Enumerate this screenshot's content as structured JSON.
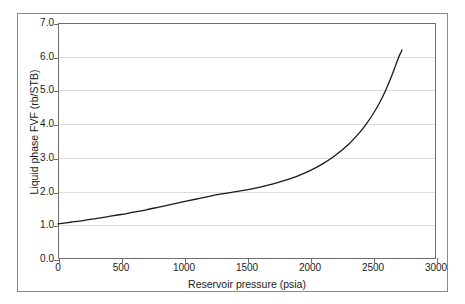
{
  "chart_data": {
    "type": "line",
    "title": "",
    "xlabel": "Reservoir pressure (psia)",
    "ylabel": "Liquid phase FVF (rb/STB)",
    "xlim": [
      0,
      3000
    ],
    "ylim": [
      0,
      7.0
    ],
    "xticks": [
      0,
      500,
      1000,
      1500,
      2000,
      2500,
      3000
    ],
    "xtick_labels": [
      "0",
      "500",
      "1000",
      "1500",
      "2000",
      "2500",
      "3000"
    ],
    "yticks": [
      0.0,
      1.0,
      2.0,
      3.0,
      4.0,
      5.0,
      6.0,
      7.0
    ],
    "ytick_labels": [
      "0.0",
      "1.0",
      "2.0",
      "3.0",
      "4.0",
      "5.0",
      "6.0",
      "7.0"
    ],
    "grid": "horizontal",
    "grid_color": "#dcdcdc",
    "legend": "none",
    "line_color": "#1a1a1a",
    "series": [
      {
        "name": "Liquid phase FVF",
        "x": [
          0,
          100,
          200,
          300,
          400,
          500,
          600,
          700,
          800,
          900,
          1000,
          1100,
          1200,
          1300,
          1400,
          1500,
          1600,
          1700,
          1800,
          1900,
          2000,
          2100,
          2200,
          2300,
          2400,
          2450,
          2500,
          2550,
          2600,
          2650,
          2680,
          2700,
          2720,
          2730
        ],
        "y": [
          1.04,
          1.09,
          1.14,
          1.2,
          1.26,
          1.32,
          1.39,
          1.46,
          1.54,
          1.62,
          1.7,
          1.78,
          1.86,
          1.93,
          1.99,
          2.05,
          2.13,
          2.22,
          2.33,
          2.46,
          2.62,
          2.82,
          3.07,
          3.38,
          3.78,
          4.02,
          4.3,
          4.62,
          5.0,
          5.45,
          5.75,
          5.95,
          6.12,
          6.2
        ]
      }
    ]
  },
  "figure": {
    "border_color": "#8a8a8a",
    "background": "#ffffff"
  }
}
